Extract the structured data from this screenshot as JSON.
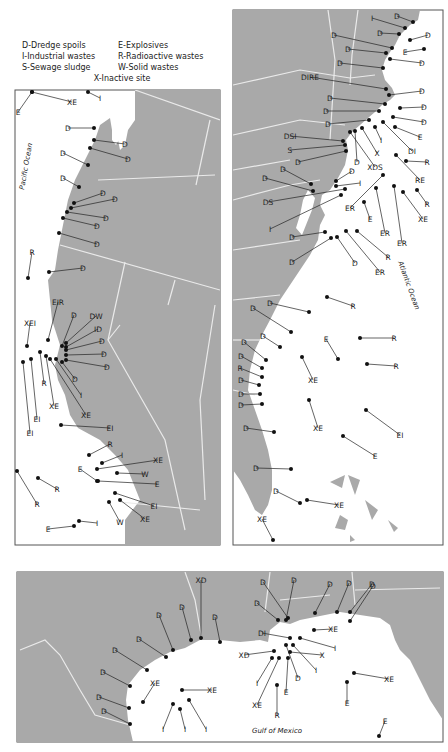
{
  "legend": {
    "items": [
      {
        "code": "D",
        "label": "D-Dredge spoils"
      },
      {
        "code": "E",
        "label": "E-Explosives"
      },
      {
        "code": "I",
        "label": "I-Industrial wastes"
      },
      {
        "code": "R",
        "label": "R-Radioactive wastes"
      },
      {
        "code": "S",
        "label": "S-Sewage sludge"
      },
      {
        "code": "W",
        "label": "W-Solid wastes"
      },
      {
        "code": "X",
        "label": "X-Inactive site"
      }
    ]
  },
  "colors": {
    "land": "#a9a9a9",
    "water": "#ffffff",
    "border": "#e6e6e6",
    "frame": "#555555",
    "marker": "#111111"
  },
  "panels": {
    "west": {
      "ocean_label": "Pacific Ocean"
    },
    "east": {
      "ocean_label": "Atlantic Ocean"
    },
    "gulf": {
      "ocean_label": "Gulf of Mexico"
    }
  },
  "sites": {
    "west": [
      {
        "label": "E",
        "x": 18,
        "y": 112,
        "dx": 32,
        "dy": 92
      },
      {
        "label": "XE",
        "x": 72,
        "y": 102,
        "dx": 32,
        "dy": 92
      },
      {
        "label": "I",
        "x": 100,
        "y": 98,
        "dx": 88,
        "dy": 92
      },
      {
        "label": "D",
        "x": 68,
        "y": 128,
        "dx": 94,
        "dy": 128
      },
      {
        "label": "D",
        "x": 125,
        "y": 144,
        "dx": 94,
        "dy": 140
      },
      {
        "label": "D",
        "x": 128,
        "y": 159,
        "dx": 90,
        "dy": 148
      },
      {
        "label": "D",
        "x": 63,
        "y": 153,
        "dx": 88,
        "dy": 165
      },
      {
        "label": "D",
        "x": 63,
        "y": 178,
        "dx": 79,
        "dy": 187
      },
      {
        "label": "D",
        "x": 103,
        "y": 193,
        "dx": 74,
        "dy": 203
      },
      {
        "label": "D",
        "x": 115,
        "y": 199,
        "dx": 71,
        "dy": 208
      },
      {
        "label": "D",
        "x": 106,
        "y": 218,
        "dx": 67,
        "dy": 212
      },
      {
        "label": "D",
        "x": 97,
        "y": 226,
        "dx": 63,
        "dy": 218
      },
      {
        "label": "D",
        "x": 97,
        "y": 244,
        "dx": 59,
        "dy": 233
      },
      {
        "label": "R",
        "x": 32,
        "y": 252,
        "dx": 28,
        "dy": 278
      },
      {
        "label": "D",
        "x": 83,
        "y": 268,
        "dx": 49,
        "dy": 272
      },
      {
        "label": "EIR",
        "x": 58,
        "y": 302,
        "dx": 48,
        "dy": 340
      },
      {
        "label": "D",
        "x": 74,
        "y": 315,
        "dx": 62,
        "dy": 346
      },
      {
        "label": "DW",
        "x": 96,
        "y": 316,
        "dx": 66,
        "dy": 343
      },
      {
        "label": "ID",
        "x": 98,
        "y": 329,
        "dx": 66,
        "dy": 347
      },
      {
        "label": "D",
        "x": 102,
        "y": 341,
        "dx": 66,
        "dy": 350
      },
      {
        "label": "D",
        "x": 104,
        "y": 354,
        "dx": 66,
        "dy": 355
      },
      {
        "label": "D",
        "x": 107,
        "y": 367,
        "dx": 66,
        "dy": 360
      },
      {
        "label": "XEI",
        "x": 30,
        "y": 323,
        "dx": 27,
        "dy": 346
      },
      {
        "label": "D",
        "x": 75,
        "y": 379,
        "dx": 62,
        "dy": 362
      },
      {
        "label": "I",
        "x": 81,
        "y": 395,
        "dx": 56,
        "dy": 359
      },
      {
        "label": "R",
        "x": 44,
        "y": 383,
        "dx": 40,
        "dy": 352
      },
      {
        "label": "XE",
        "x": 54,
        "y": 406,
        "dx": 46,
        "dy": 356
      },
      {
        "label": "XE",
        "x": 86,
        "y": 415,
        "dx": 50,
        "dy": 359
      },
      {
        "label": "EI",
        "x": 30,
        "y": 433,
        "dx": 23,
        "dy": 362
      },
      {
        "label": "EI",
        "x": 37,
        "y": 419,
        "dx": 31,
        "dy": 359
      },
      {
        "label": "EI",
        "x": 110,
        "y": 428,
        "dx": 61,
        "dy": 425
      },
      {
        "label": "R",
        "x": 110,
        "y": 444,
        "dx": 89,
        "dy": 455
      },
      {
        "label": "I",
        "x": 122,
        "y": 455,
        "dx": 102,
        "dy": 463
      },
      {
        "label": "XE",
        "x": 158,
        "y": 460,
        "dx": 97,
        "dy": 469
      },
      {
        "label": "W",
        "x": 145,
        "y": 474,
        "dx": 117,
        "dy": 473
      },
      {
        "label": "E",
        "x": 80,
        "y": 469,
        "dx": 97,
        "dy": 481
      },
      {
        "label": "E",
        "x": 157,
        "y": 484,
        "dx": 98,
        "dy": 481
      },
      {
        "label": "EI",
        "x": 154,
        "y": 506,
        "dx": 115,
        "dy": 493
      },
      {
        "label": "XE",
        "x": 145,
        "y": 519,
        "dx": 120,
        "dy": 500
      },
      {
        "label": "W",
        "x": 120,
        "y": 522,
        "dx": 109,
        "dy": 502
      },
      {
        "label": "R",
        "x": 57,
        "y": 489,
        "dx": 38,
        "dy": 478
      },
      {
        "label": "R",
        "x": 37,
        "y": 504,
        "dx": 17,
        "dy": 471
      },
      {
        "label": "I",
        "x": 97,
        "y": 523,
        "dx": 79,
        "dy": 521
      },
      {
        "label": "E",
        "x": 48,
        "y": 529,
        "dx": 74,
        "dy": 526
      }
    ],
    "east": [
      {
        "label": "I",
        "x": 372,
        "y": 18,
        "dx": 405,
        "dy": 28
      },
      {
        "label": "D",
        "x": 397,
        "y": 16,
        "dx": 413,
        "dy": 22
      },
      {
        "label": "D",
        "x": 380,
        "y": 33,
        "dx": 399,
        "dy": 34
      },
      {
        "label": "D",
        "x": 428,
        "y": 35,
        "dx": 410,
        "dy": 40
      },
      {
        "label": "E",
        "x": 405,
        "y": 52,
        "dx": 424,
        "dy": 49
      },
      {
        "label": "D",
        "x": 334,
        "y": 35,
        "dx": 392,
        "dy": 48
      },
      {
        "label": "D",
        "x": 348,
        "y": 49,
        "dx": 386,
        "dy": 53
      },
      {
        "label": "D",
        "x": 422,
        "y": 63,
        "dx": 390,
        "dy": 59
      },
      {
        "label": "D",
        "x": 340,
        "y": 63,
        "dx": 383,
        "dy": 68
      },
      {
        "label": "DIRE",
        "x": 310,
        "y": 77,
        "dx": 386,
        "dy": 89
      },
      {
        "label": "D",
        "x": 422,
        "y": 91,
        "dx": 389,
        "dy": 95
      },
      {
        "label": "D",
        "x": 330,
        "y": 98,
        "dx": 385,
        "dy": 104
      },
      {
        "label": "D",
        "x": 424,
        "y": 107,
        "dx": 400,
        "dy": 108
      },
      {
        "label": "D",
        "x": 326,
        "y": 111,
        "dx": 379,
        "dy": 111
      },
      {
        "label": "D",
        "x": 424,
        "y": 122,
        "dx": 393,
        "dy": 117
      },
      {
        "label": "D",
        "x": 328,
        "y": 124,
        "dx": 369,
        "dy": 120
      },
      {
        "label": "E",
        "x": 420,
        "y": 137,
        "dx": 395,
        "dy": 127
      },
      {
        "label": "DSI",
        "x": 290,
        "y": 136,
        "dx": 343,
        "dy": 141
      },
      {
        "label": "I",
        "x": 381,
        "y": 140,
        "dx": 375,
        "dy": 127
      },
      {
        "label": "S",
        "x": 290,
        "y": 150,
        "dx": 345,
        "dy": 145
      },
      {
        "label": "X",
        "x": 377,
        "y": 153,
        "dx": 362,
        "dy": 128
      },
      {
        "label": "DI",
        "x": 412,
        "y": 151,
        "dx": 383,
        "dy": 122
      },
      {
        "label": "D",
        "x": 298,
        "y": 162,
        "dx": 346,
        "dy": 151
      },
      {
        "label": "D",
        "x": 357,
        "y": 162,
        "dx": 355,
        "dy": 131
      },
      {
        "label": "XDS",
        "x": 375,
        "y": 167,
        "dx": 350,
        "dy": 132
      },
      {
        "label": "R",
        "x": 427,
        "y": 162,
        "dx": 406,
        "dy": 161
      },
      {
        "label": "D",
        "x": 283,
        "y": 169,
        "dx": 311,
        "dy": 184
      },
      {
        "label": "RE",
        "x": 420,
        "y": 180,
        "dx": 396,
        "dy": 155
      },
      {
        "label": "D",
        "x": 265,
        "y": 178,
        "dx": 313,
        "dy": 191
      },
      {
        "label": "D",
        "x": 352,
        "y": 171,
        "dx": 336,
        "dy": 181
      },
      {
        "label": "I",
        "x": 360,
        "y": 183,
        "dx": 336,
        "dy": 186
      },
      {
        "label": "DS",
        "x": 268,
        "y": 202,
        "dx": 345,
        "dy": 189
      },
      {
        "label": "R",
        "x": 427,
        "y": 204,
        "dx": 417,
        "dy": 190
      },
      {
        "label": "ER",
        "x": 350,
        "y": 208,
        "dx": 383,
        "dy": 175
      },
      {
        "label": "XE",
        "x": 423,
        "y": 219,
        "dx": 403,
        "dy": 192
      },
      {
        "label": "E",
        "x": 370,
        "y": 219,
        "dx": 364,
        "dy": 202
      },
      {
        "label": "I",
        "x": 270,
        "y": 229,
        "dx": 341,
        "dy": 195
      },
      {
        "label": "ER",
        "x": 385,
        "y": 233,
        "dx": 376,
        "dy": 188
      },
      {
        "label": "ER",
        "x": 402,
        "y": 243,
        "dx": 394,
        "dy": 186
      },
      {
        "label": "D",
        "x": 292,
        "y": 237,
        "dx": 325,
        "dy": 232
      },
      {
        "label": "R",
        "x": 388,
        "y": 257,
        "dx": 357,
        "dy": 231
      },
      {
        "label": "ER",
        "x": 380,
        "y": 272,
        "dx": 346,
        "dy": 231
      },
      {
        "label": "D",
        "x": 355,
        "y": 263,
        "dx": 337,
        "dy": 237
      },
      {
        "label": "D",
        "x": 292,
        "y": 262,
        "dx": 331,
        "dy": 238
      },
      {
        "label": "R",
        "x": 353,
        "y": 306,
        "dx": 327,
        "dy": 297
      },
      {
        "label": "D",
        "x": 270,
        "y": 303,
        "dx": 309,
        "dy": 312
      },
      {
        "label": "D",
        "x": 253,
        "y": 308,
        "dx": 291,
        "dy": 332
      },
      {
        "label": "D",
        "x": 263,
        "y": 336,
        "dx": 280,
        "dy": 347
      },
      {
        "label": "D",
        "x": 244,
        "y": 342,
        "dx": 266,
        "dy": 360
      },
      {
        "label": "D",
        "x": 241,
        "y": 356,
        "dx": 262,
        "dy": 368
      },
      {
        "label": "R",
        "x": 240,
        "y": 368,
        "dx": 262,
        "dy": 377
      },
      {
        "label": "D",
        "x": 241,
        "y": 380,
        "dx": 259,
        "dy": 385
      },
      {
        "label": "D",
        "x": 241,
        "y": 394,
        "dx": 260,
        "dy": 394
      },
      {
        "label": "D",
        "x": 241,
        "y": 405,
        "dx": 262,
        "dy": 404
      },
      {
        "label": "D",
        "x": 246,
        "y": 428,
        "dx": 274,
        "dy": 432
      },
      {
        "label": "R",
        "x": 394,
        "y": 338,
        "dx": 360,
        "dy": 338
      },
      {
        "label": "E",
        "x": 326,
        "y": 339,
        "dx": 338,
        "dy": 359
      },
      {
        "label": "R",
        "x": 396,
        "y": 366,
        "dx": 367,
        "dy": 364
      },
      {
        "label": "XE",
        "x": 313,
        "y": 380,
        "dx": 302,
        "dy": 357
      },
      {
        "label": "XE",
        "x": 318,
        "y": 428,
        "dx": 309,
        "dy": 400
      },
      {
        "label": "EI",
        "x": 400,
        "y": 435,
        "dx": 366,
        "dy": 410
      },
      {
        "label": "E",
        "x": 375,
        "y": 456,
        "dx": 343,
        "dy": 436
      },
      {
        "label": "D",
        "x": 256,
        "y": 468,
        "dx": 291,
        "dy": 469
      },
      {
        "label": "D",
        "x": 276,
        "y": 491,
        "dx": 300,
        "dy": 503
      },
      {
        "label": "XE",
        "x": 339,
        "y": 505,
        "dx": 307,
        "dy": 500
      },
      {
        "label": "XE",
        "x": 262,
        "y": 519,
        "dx": 273,
        "dy": 540
      }
    ],
    "gulf": [
      {
        "label": "XD",
        "x": 201,
        "y": 580,
        "dx": 201,
        "dy": 638
      },
      {
        "label": "D",
        "x": 182,
        "y": 607,
        "dx": 191,
        "dy": 640
      },
      {
        "label": "D",
        "x": 215,
        "y": 617,
        "dx": 220,
        "dy": 642
      },
      {
        "label": "D",
        "x": 159,
        "y": 615,
        "dx": 173,
        "dy": 650
      },
      {
        "label": "D",
        "x": 139,
        "y": 639,
        "dx": 166,
        "dy": 657
      },
      {
        "label": "D",
        "x": 115,
        "y": 650,
        "dx": 147,
        "dy": 670
      },
      {
        "label": "D",
        "x": 103,
        "y": 672,
        "dx": 130,
        "dy": 686
      },
      {
        "label": "D",
        "x": 99,
        "y": 697,
        "dx": 129,
        "dy": 708
      },
      {
        "label": "D",
        "x": 104,
        "y": 711,
        "dx": 130,
        "dy": 724
      },
      {
        "label": "XE",
        "x": 155,
        "y": 683,
        "dx": 143,
        "dy": 702
      },
      {
        "label": "XE",
        "x": 212,
        "y": 690,
        "dx": 182,
        "dy": 690
      },
      {
        "label": "I",
        "x": 163,
        "y": 729,
        "dx": 173,
        "dy": 704
      },
      {
        "label": "I",
        "x": 185,
        "y": 729,
        "dx": 180,
        "dy": 709
      },
      {
        "label": "I",
        "x": 206,
        "y": 729,
        "dx": 189,
        "dy": 700
      },
      {
        "label": "D",
        "x": 263,
        "y": 582,
        "dx": 288,
        "dy": 618
      },
      {
        "label": "D",
        "x": 294,
        "y": 580,
        "dx": 286,
        "dy": 620
      },
      {
        "label": "D",
        "x": 257,
        "y": 603,
        "dx": 278,
        "dy": 620
      },
      {
        "label": "D",
        "x": 330,
        "y": 584,
        "dx": 315,
        "dy": 613
      },
      {
        "label": "D",
        "x": 349,
        "y": 583,
        "dx": 337,
        "dy": 612
      },
      {
        "label": "D",
        "x": 372,
        "y": 584,
        "dx": 350,
        "dy": 612
      },
      {
        "label": "D",
        "x": 373,
        "y": 586,
        "dx": 350,
        "dy": 621
      },
      {
        "label": "XE",
        "x": 333,
        "y": 629,
        "dx": 314,
        "dy": 630
      },
      {
        "label": "DI",
        "x": 262,
        "y": 633,
        "dx": 290,
        "dy": 638
      },
      {
        "label": "I",
        "x": 335,
        "y": 648,
        "dx": 300,
        "dy": 638
      },
      {
        "label": "XD",
        "x": 244,
        "y": 655,
        "dx": 274,
        "dy": 651
      },
      {
        "label": "X",
        "x": 322,
        "y": 655,
        "dx": 290,
        "dy": 652
      },
      {
        "label": "I",
        "x": 316,
        "y": 670,
        "dx": 293,
        "dy": 645
      },
      {
        "label": "D",
        "x": 298,
        "y": 678,
        "dx": 286,
        "dy": 645
      },
      {
        "label": "I",
        "x": 257,
        "y": 683,
        "dx": 272,
        "dy": 658
      },
      {
        "label": "E",
        "x": 286,
        "y": 692,
        "dx": 288,
        "dy": 658
      },
      {
        "label": "XE",
        "x": 257,
        "y": 705,
        "dx": 279,
        "dy": 658
      },
      {
        "label": "R",
        "x": 277,
        "y": 715,
        "dx": 277,
        "dy": 685
      },
      {
        "label": "XE",
        "x": 389,
        "y": 679,
        "dx": 354,
        "dy": 673
      },
      {
        "label": "E",
        "x": 347,
        "y": 703,
        "dx": 347,
        "dy": 682
      },
      {
        "label": "E",
        "x": 385,
        "y": 721,
        "dx": 379,
        "dy": 736
      }
    ]
  }
}
